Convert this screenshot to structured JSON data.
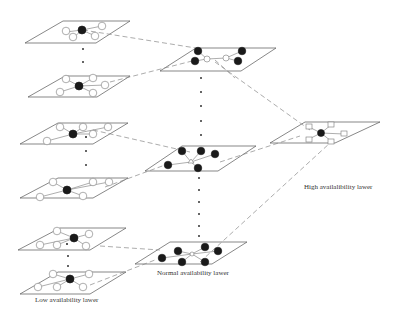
{
  "diagram": {
    "type": "layered-network",
    "colors": {
      "line": "#555555",
      "node_filled": "#1a1a1a",
      "node_hollow_stroke": "#777777",
      "dash": "#777777"
    },
    "layers": [
      {
        "name": "Low availability layer",
        "label": "Low availability lawer",
        "planes": 6,
        "node_shape": "circle",
        "hub": "filled"
      },
      {
        "name": "Normal availability layer",
        "label": "Normal availability lawer",
        "planes": 3,
        "node_shape": "circle",
        "nodes": "filled"
      },
      {
        "name": "High availability layer",
        "label": "High availalibility lawer",
        "planes": 1,
        "node_shape": "square",
        "hub": "filled"
      }
    ]
  },
  "labels": {
    "low": "Low availability lawer",
    "normal": "Normal availability lawer",
    "high": "High availalibility lawer"
  }
}
